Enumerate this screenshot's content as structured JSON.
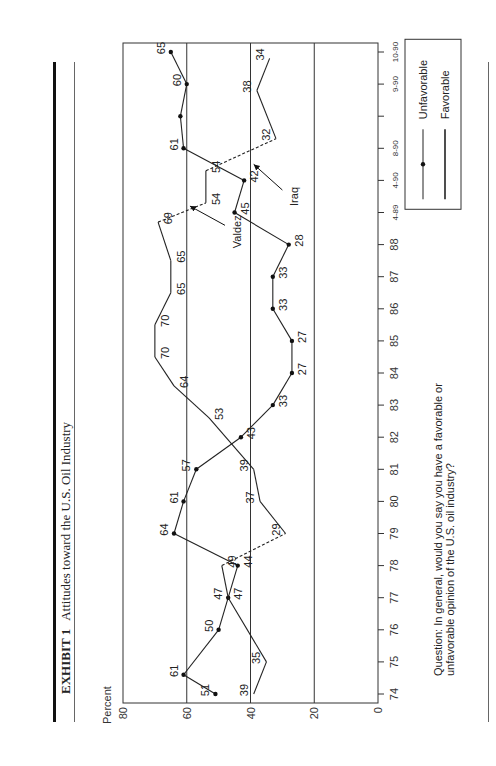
{
  "header": {
    "exhibit_label": "EXHIBIT 1",
    "title": "Attitudes toward the U.S. Oil Industry"
  },
  "footer": {
    "question": "Question: In general, would you say you have a favorable or unfavorable opinion of the U.S. oil industry?"
  },
  "chart_data": {
    "type": "line",
    "title": "Attitudes toward the U.S. Oil Industry",
    "xlabel": "",
    "ylabel": "Percent",
    "ylim": [
      0,
      80
    ],
    "yticks": [
      0,
      20,
      40,
      60,
      80
    ],
    "grid": "horizontal at 20, 40, 60",
    "legend_position": "right, inside frame",
    "x_ticks": [
      "74",
      "75",
      "76",
      "77",
      "78",
      "79",
      "80",
      "81",
      "82",
      "83",
      "84",
      "85",
      "86",
      "87",
      "88",
      "4-89",
      "4-90",
      "8-90",
      "",
      "9-90",
      "10-90"
    ],
    "series": [
      {
        "name": "Unfavorable",
        "marker": "dot",
        "points": [
          {
            "x": "74",
            "pos": 0.0,
            "y": 51
          },
          {
            "x": "74",
            "pos": 0.6,
            "y": 61
          },
          {
            "x": "76",
            "pos": 2.0,
            "y": 50
          },
          {
            "x": "77",
            "pos": 3.0,
            "y": 47
          },
          {
            "x": "78",
            "pos": 4.0,
            "y": 44
          },
          {
            "x": "79",
            "pos": 5.0,
            "y": 64
          },
          {
            "x": "80",
            "pos": 6.0,
            "y": 61
          },
          {
            "x": "81",
            "pos": 7.0,
            "y": 57
          },
          {
            "x": "82",
            "pos": 8.0,
            "y": 43
          },
          {
            "x": "83",
            "pos": 9.0,
            "y": 33
          },
          {
            "x": "84",
            "pos": 10.0,
            "y": 27
          },
          {
            "x": "85",
            "pos": 11.0,
            "y": 27
          },
          {
            "x": "86",
            "pos": 12.0,
            "y": 33
          },
          {
            "x": "87",
            "pos": 13.0,
            "y": 33
          },
          {
            "x": "88",
            "pos": 14.0,
            "y": 28
          },
          {
            "x": "4-89",
            "pos": 15.0,
            "y": 45
          },
          {
            "x": "4-90",
            "pos": 16.0,
            "y": 42
          },
          {
            "x": "8-90",
            "pos": 17.0,
            "y": 61
          },
          {
            "x": "",
            "pos": 18.0,
            "y": 62,
            "label": ""
          },
          {
            "x": "9-90",
            "pos": 19.0,
            "y": 60
          },
          {
            "x": "10-90",
            "pos": 20.0,
            "y": 65
          }
        ]
      },
      {
        "name": "Favorable",
        "marker": "none",
        "points": [
          {
            "x": "74",
            "pos": 0.0,
            "y": 39
          },
          {
            "x": "75",
            "pos": 1.0,
            "y": 35
          },
          {
            "x": "77",
            "pos": 3.0,
            "y": 47
          },
          {
            "x": "78",
            "pos": 4.0,
            "y": 49
          },
          {
            "x": "79",
            "pos": 5.0,
            "y": 29,
            "dashed_from_prev": true
          },
          {
            "x": "80",
            "pos": 6.0,
            "y": 37
          },
          {
            "x": "81",
            "pos": 7.0,
            "y": 39
          },
          {
            "x": "83",
            "pos": 8.6,
            "y": 53
          },
          {
            "x": "84",
            "pos": 9.6,
            "y": 64
          },
          {
            "x": "85",
            "pos": 10.5,
            "y": 70
          },
          {
            "x": "86",
            "pos": 11.5,
            "y": 70
          },
          {
            "x": "87",
            "pos": 12.5,
            "y": 65
          },
          {
            "x": "88",
            "pos": 13.5,
            "y": 65
          },
          {
            "x": "4-89",
            "pos": 14.7,
            "y": 69
          },
          {
            "x": "4-89",
            "pos": 15.3,
            "y": 54,
            "dashed_from_prev": true
          },
          {
            "x": "4-90",
            "pos": 16.3,
            "y": 54
          },
          {
            "x": "8-90",
            "pos": 17.3,
            "y": 32,
            "dashed_from_prev": true
          },
          {
            "x": "9-90",
            "pos": 18.8,
            "y": 38
          },
          {
            "x": "10-90",
            "pos": 19.8,
            "y": 34
          }
        ]
      }
    ],
    "annotations": [
      {
        "text": "Valdez",
        "points_to": "4-89",
        "value_near": 60
      },
      {
        "text": "Iraq",
        "points_to": "4-90",
        "value_near": 40
      }
    ]
  }
}
